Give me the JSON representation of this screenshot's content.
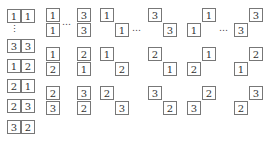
{
  "diagram": {
    "ellipsis": "…",
    "vertical_ellipsis": "⋮",
    "left_column": [
      {
        "a": "1",
        "b": "1",
        "x": 7,
        "y": 9
      },
      {
        "a": "3",
        "b": "3",
        "x": 7,
        "y": 39
      },
      {
        "a": "1",
        "b": "2",
        "x": 7,
        "y": 59
      },
      {
        "a": "2",
        "b": "1",
        "x": 7,
        "y": 79
      },
      {
        "a": "2",
        "b": "3",
        "x": 7,
        "y": 99
      },
      {
        "a": "3",
        "b": "2",
        "x": 7,
        "y": 120
      }
    ],
    "rows": [
      {
        "y": 8,
        "vertical": [
          {
            "top": "1",
            "bottom": "1",
            "x": 46
          },
          {
            "top": "3",
            "bottom": "3",
            "x": 77
          }
        ],
        "diag_down": [
          {
            "a": "1",
            "b": "1",
            "x": 100
          },
          {
            "a": "3",
            "b": "3",
            "x": 148
          }
        ],
        "diag_up": [
          {
            "a": "1",
            "b": "1",
            "x": 187
          },
          {
            "a": "3",
            "b": "3",
            "x": 234
          }
        ],
        "has_ellipsis": true
      },
      {
        "y": 47,
        "vertical": [
          {
            "top": "1",
            "bottom": "2",
            "x": 46
          },
          {
            "top": "2",
            "bottom": "1",
            "x": 77
          }
        ],
        "diag_down": [
          {
            "a": "1",
            "b": "2",
            "x": 100
          },
          {
            "a": "2",
            "b": "1",
            "x": 148
          }
        ],
        "diag_up": [
          {
            "a": "1",
            "b": "2",
            "x": 187
          },
          {
            "a": "2",
            "b": "1",
            "x": 234
          }
        ],
        "has_ellipsis": false
      },
      {
        "y": 86,
        "vertical": [
          {
            "top": "2",
            "bottom": "3",
            "x": 46
          },
          {
            "top": "3",
            "bottom": "2",
            "x": 77
          }
        ],
        "diag_down": [
          {
            "a": "2",
            "b": "3",
            "x": 100
          },
          {
            "a": "3",
            "b": "2",
            "x": 148
          }
        ],
        "diag_up": [
          {
            "a": "2",
            "b": "3",
            "x": 187
          },
          {
            "a": "3",
            "b": "2",
            "x": 234
          }
        ],
        "has_ellipsis": false
      }
    ]
  }
}
